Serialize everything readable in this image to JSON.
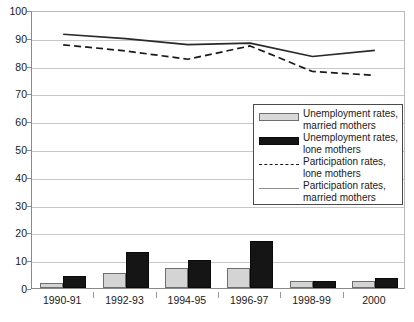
{
  "chart_data": {
    "type": "bar",
    "title": "",
    "subtitle": "",
    "xlabel": "",
    "ylabel": "",
    "ylim": [
      0,
      100
    ],
    "ytick_step": 10,
    "yticks": [
      0,
      10,
      20,
      30,
      40,
      50,
      60,
      70,
      80,
      90,
      100
    ],
    "ytick_labels": [
      "0",
      "10",
      "20",
      "30",
      "40",
      "50",
      "60",
      "70",
      "80",
      "90",
      "100"
    ],
    "grid": true,
    "legend_position": "center-right",
    "categories": [
      "1990-91",
      "1992-93",
      "1994-95",
      "1996-97",
      "1998-99",
      "2000"
    ],
    "series": [
      {
        "name": "Unemployment rates, married mothers",
        "kind": "bar",
        "color": "#d4d4d4",
        "values": [
          1.8,
          5.3,
          7.3,
          7.3,
          2.4,
          2.4
        ]
      },
      {
        "name": "Unemployment rates, lone mothers",
        "kind": "bar",
        "color": "#151515",
        "values": [
          4.2,
          12.9,
          10.1,
          16.8,
          2.4,
          3.6
        ]
      },
      {
        "name": "Participation rates, lone mothers",
        "kind": "line",
        "style": "dashed",
        "color": "#1a1a1a",
        "values": [
          88.2,
          86.0,
          83.0,
          87.8,
          78.6,
          77.2
        ]
      },
      {
        "name": "Participation rates, married mothers",
        "kind": "line",
        "style": "solid",
        "color": "#2a2a2a",
        "values": [
          92.0,
          90.4,
          88.3,
          88.8,
          84.0,
          86.2
        ]
      }
    ],
    "annotations": []
  },
  "legend": {
    "entries": [
      {
        "swatch": "light-box",
        "line1": "Unemployment rates,",
        "line2": "married mothers"
      },
      {
        "swatch": "dark-box",
        "line1": "Unemployment rates,",
        "line2": "lone mothers"
      },
      {
        "swatch": "dashed-line",
        "line1": "Participation rates,",
        "line2": "lone mothers"
      },
      {
        "swatch": "solid-line",
        "line1": "Participation rates,",
        "line2": "married mothers"
      }
    ]
  },
  "colors": {
    "bar_light": "#d4d4d4",
    "bar_dark": "#151515",
    "grid": "#c8c8c8",
    "axis": "#8a8a8a",
    "text": "#1a1a1a"
  }
}
